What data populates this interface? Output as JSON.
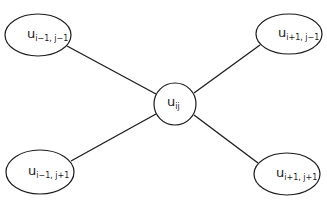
{
  "diagram": {
    "center": {
      "base": "u",
      "sub": "ij"
    },
    "nodes": [
      {
        "id": "top-left",
        "base": "u",
        "sub": "i−1, j−1"
      },
      {
        "id": "top-right",
        "base": "u",
        "sub": "i+1, j−1"
      },
      {
        "id": "bottom-left",
        "base": "u",
        "sub": "i−1, j+1"
      },
      {
        "id": "bottom-right",
        "base": "u",
        "sub": "i+1, j+1"
      }
    ]
  }
}
